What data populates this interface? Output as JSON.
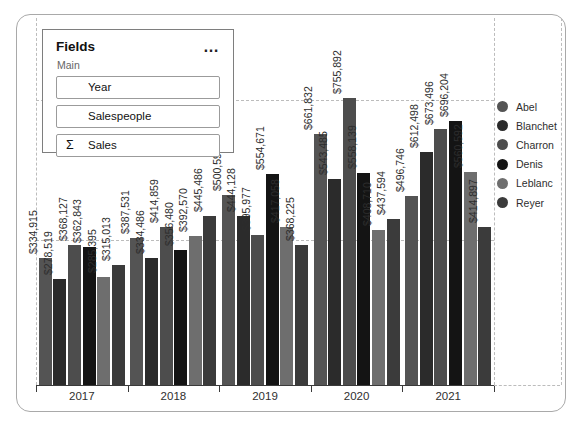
{
  "fields_panel": {
    "title": "Fields",
    "more_options": "…",
    "section": "Main",
    "fields": [
      {
        "icon": "",
        "label": "Year"
      },
      {
        "icon": "",
        "label": "Salespeople"
      },
      {
        "icon": "Σ",
        "label": "Sales"
      }
    ]
  },
  "chart_data": {
    "type": "bar",
    "title": "",
    "categories": [
      "2017",
      "2018",
      "2019",
      "2020",
      "2021"
    ],
    "series": [
      {
        "name": "Abel",
        "color": "#545454",
        "values": [
          334915,
          387531,
          500597,
          661832,
          496746
        ]
      },
      {
        "name": "Blanchet",
        "color": "#2b2b2b",
        "values": [
          278519,
          334486,
          444128,
          543485,
          612498
        ]
      },
      {
        "name": "Charron",
        "color": "#4d4d4d",
        "values": [
          368127,
          414859,
          395977,
          755892,
          673496
        ]
      },
      {
        "name": "Denis",
        "color": "#141414",
        "values": [
          362843,
          356480,
          554671,
          558139,
          696204
        ]
      },
      {
        "name": "Leblanc",
        "color": "#6e6e6e",
        "values": [
          285395,
          392570,
          417058,
          408710,
          560592
        ]
      },
      {
        "name": "Reyer",
        "color": "#3b3b3b",
        "values": [
          315013,
          445486,
          368225,
          437594,
          414897
        ]
      }
    ],
    "value_label_format": "$#,##0",
    "value_label_rotation": -90,
    "xlabel": "",
    "ylabel": "",
    "ylim": [
      0,
      800000
    ],
    "y_axis_labels_visible": false,
    "grid": "dashed",
    "legend_position": "right"
  }
}
